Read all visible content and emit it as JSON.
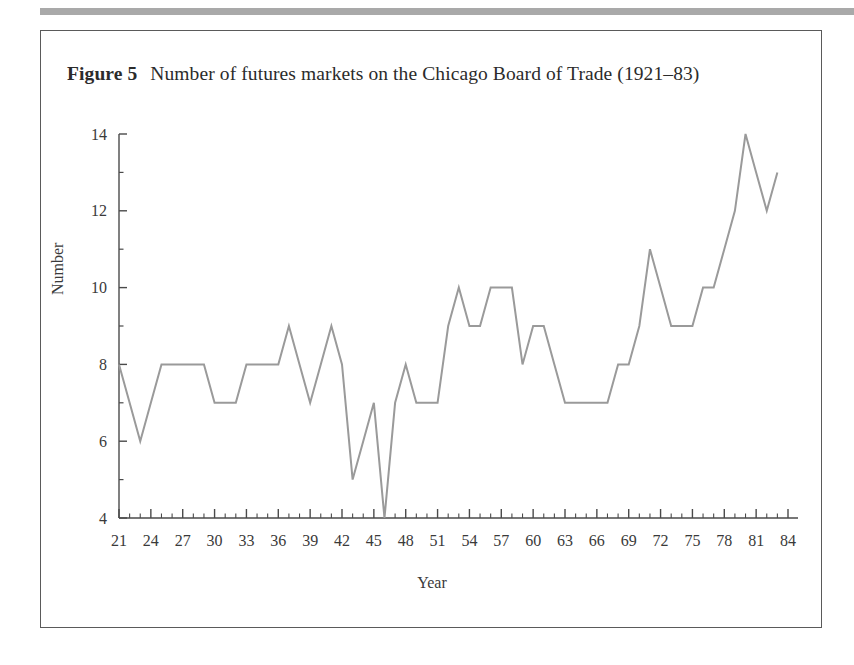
{
  "figure": {
    "label": "Figure 5",
    "title": "Number of futures markets on the Chicago Board of Trade (1921–83)"
  },
  "colors": {
    "line": "#9a9a9a",
    "axis": "#4a4a4a",
    "text": "#3a3a3a",
    "top_rule": "#a9a9a9",
    "box_border": "#5a5a5a",
    "background": "#ffffff"
  },
  "chart_data": {
    "type": "line",
    "title": "Number of futures markets on the Chicago Board of Trade (1921–83)",
    "xlabel": "Year",
    "ylabel": "Number",
    "xlim": [
      21,
      84
    ],
    "ylim": [
      4,
      14
    ],
    "grid": false,
    "legend": null,
    "xticks": [
      21,
      24,
      27,
      30,
      33,
      36,
      39,
      42,
      45,
      48,
      51,
      54,
      57,
      60,
      63,
      66,
      69,
      72,
      75,
      78,
      81,
      84
    ],
    "xticklabels": [
      "21",
      "24",
      "27",
      "30",
      "33",
      "36",
      "39",
      "42",
      "45",
      "48",
      "51",
      "54",
      "57",
      "60",
      "63",
      "66",
      "69",
      "72",
      "75",
      "78",
      "81",
      "84"
    ],
    "yticks": [
      4,
      6,
      8,
      10,
      12,
      14
    ],
    "yticklabels": [
      "4",
      "6",
      "8",
      "10",
      "12",
      "14"
    ],
    "minor_xticks_interval": 1,
    "x": [
      21,
      22,
      23,
      24,
      25,
      26,
      27,
      28,
      29,
      30,
      31,
      32,
      33,
      34,
      35,
      36,
      37,
      38,
      39,
      40,
      41,
      42,
      43,
      44,
      45,
      46,
      47,
      48,
      49,
      50,
      51,
      52,
      53,
      54,
      55,
      56,
      57,
      58,
      59,
      60,
      61,
      62,
      63,
      64,
      65,
      66,
      67,
      68,
      69,
      70,
      71,
      72,
      73,
      74,
      75,
      76,
      77,
      78,
      79,
      80,
      81,
      82,
      83
    ],
    "series": [
      {
        "name": "Number of futures markets",
        "values": [
          8,
          7,
          6,
          7,
          8,
          8,
          8,
          8,
          8,
          7,
          7,
          7,
          8,
          8,
          8,
          8,
          9,
          8,
          7,
          8,
          9,
          8,
          5,
          6,
          7,
          4,
          7,
          8,
          7,
          7,
          7,
          9,
          10,
          9,
          9,
          10,
          10,
          10,
          8,
          9,
          9,
          8,
          7,
          7,
          7,
          7,
          7,
          8,
          8,
          9,
          11,
          10,
          9,
          9,
          9,
          10,
          10,
          11,
          12,
          14,
          13,
          12,
          13
        ]
      }
    ]
  }
}
